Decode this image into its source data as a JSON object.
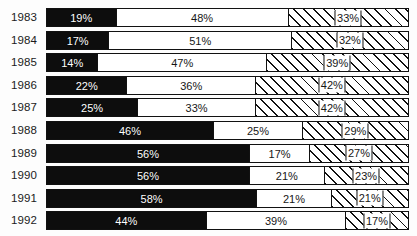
{
  "chart_data": {
    "type": "bar",
    "subtype": "horizontal-stacked-100-percent",
    "title": "",
    "subtitle": "",
    "xlabel": "",
    "ylabel": "",
    "xlim": [
      0,
      100
    ],
    "grid": false,
    "legend": false,
    "legend_position": "none",
    "axis_ticks_visible": false,
    "value_suffix": "%",
    "categories": [
      "1983",
      "1984",
      "1985",
      "1986",
      "1987",
      "1988",
      "1989",
      "1990",
      "1991",
      "1992"
    ],
    "series": [
      {
        "name": "segment-1",
        "style": "solid-black",
        "color": "#0d0d0d",
        "label_color": "#ffffff",
        "values": [
          19,
          17,
          14,
          22,
          25,
          46,
          56,
          56,
          58,
          44
        ]
      },
      {
        "name": "segment-2",
        "style": "solid-white",
        "color": "#ffffff",
        "label_color": "#161616",
        "values": [
          48,
          51,
          47,
          36,
          33,
          25,
          17,
          21,
          21,
          39
        ]
      },
      {
        "name": "segment-3",
        "style": "diagonal-hatch",
        "color": "#ffffff",
        "hatch": "/",
        "label_color": "#161616",
        "values": [
          33,
          32,
          39,
          42,
          42,
          29,
          27,
          23,
          21,
          17
        ]
      }
    ],
    "rows": [
      {
        "category": "1983",
        "values": [
          19,
          17,
          33
        ],
        "labels": [
          "19%",
          "48%",
          "33%"
        ],
        "stack": [
          19,
          48,
          33
        ]
      },
      {
        "category": "1984",
        "values": [
          17,
          51,
          32
        ],
        "labels": [
          "17%",
          "51%",
          "32%"
        ],
        "stack": [
          17,
          51,
          32
        ]
      },
      {
        "category": "1985",
        "values": [
          14,
          47,
          39
        ],
        "labels": [
          "14%",
          "47%",
          "39%"
        ],
        "stack": [
          14,
          47,
          39
        ]
      },
      {
        "category": "1986",
        "values": [
          22,
          36,
          42
        ],
        "labels": [
          "22%",
          "36%",
          "42%"
        ],
        "stack": [
          22,
          36,
          42
        ]
      },
      {
        "category": "1987",
        "values": [
          25,
          33,
          42
        ],
        "labels": [
          "25%",
          "33%",
          "42%"
        ],
        "stack": [
          25,
          33,
          42
        ]
      },
      {
        "category": "1988",
        "values": [
          46,
          25,
          29
        ],
        "labels": [
          "46%",
          "25%",
          "29%"
        ],
        "stack": [
          46,
          25,
          29
        ]
      },
      {
        "category": "1989",
        "values": [
          56,
          17,
          27
        ],
        "labels": [
          "56%",
          "17%",
          "27%"
        ],
        "stack": [
          56,
          17,
          27
        ]
      },
      {
        "category": "1990",
        "values": [
          56,
          21,
          23
        ],
        "labels": [
          "56%",
          "21%",
          "23%"
        ],
        "stack": [
          56,
          21,
          23
        ]
      },
      {
        "category": "1991",
        "values": [
          58,
          21,
          21
        ],
        "labels": [
          "58%",
          "21%",
          "21%"
        ],
        "stack": [
          58,
          21,
          21
        ]
      },
      {
        "category": "1992",
        "values": [
          44,
          39,
          17
        ],
        "labels": [
          "44%",
          "39%",
          "17%"
        ],
        "stack": [
          44,
          39,
          17
        ]
      }
    ]
  },
  "layout": {
    "bar_left": 46,
    "bar_width": 363,
    "bar_height": 19,
    "row_pitch": 22.6,
    "first_row_top": 8,
    "label_left": 11,
    "background": "#fdfdfd",
    "border_color": "#111111"
  }
}
